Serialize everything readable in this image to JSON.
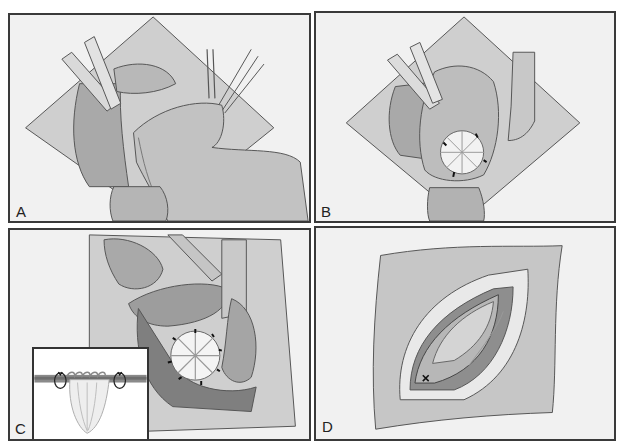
{
  "figure": {
    "panels": [
      {
        "id": "A",
        "label": "A",
        "description": "Retractors expose the surgical field; a gloved finger presses tissue toward the upper right while forceps grasp it"
      },
      {
        "id": "B",
        "label": "B",
        "description": "Tissue folded open exposing a round pleated closure secured with interrupted sutures"
      },
      {
        "id": "C",
        "label": "C",
        "description": "Close-up of the circular pleated purse-string closure with sutures around its perimeter, with a cross-section inset"
      },
      {
        "id": "D",
        "label": "D",
        "description": "Elliptical incision in draped skin with layered closure; a suture knot marked at lower left"
      }
    ],
    "inset": {
      "panel": "C",
      "description": "Cross-section showing the pleated tissue gathered between two suture loops at the tissue layer"
    },
    "colors": {
      "border": "#3a3a3a",
      "panel_background": "#f1f1f1",
      "drape": "#cfcfcf",
      "tissue": "#a9a9a9",
      "tissue_dark": "#8c8c8c",
      "line": "#555555"
    }
  }
}
